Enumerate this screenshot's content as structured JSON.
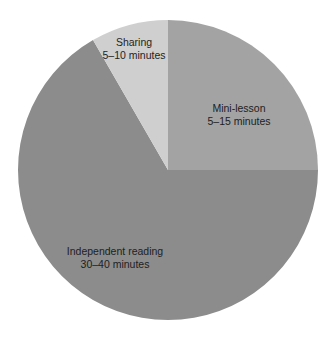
{
  "chart_data": {
    "type": "pie",
    "title": "",
    "start_angle_deg": 0,
    "direction": "clockwise",
    "categories": [
      "Mini-lesson",
      "Independent reading",
      "Sharing"
    ],
    "values": [
      90,
      240,
      30
    ],
    "units": "degrees",
    "slices": [
      {
        "label": "Mini-lesson",
        "sublabel": "5–15 minutes",
        "degrees": 90,
        "color": "#a3a3a3"
      },
      {
        "label": "Independent reading",
        "sublabel": "30–40 minutes",
        "degrees": 240,
        "color": "#8c8c8c"
      },
      {
        "label": "Sharing",
        "sublabel": "5–10 minutes",
        "degrees": 30,
        "color": "#cfcfcf"
      }
    ],
    "legend": null,
    "grid": false
  },
  "labels": {
    "mini": {
      "title": "Mini-lesson",
      "time": "5–15 minutes"
    },
    "independent": {
      "title": "Independent reading",
      "time": "30–40 minutes"
    },
    "sharing": {
      "title": "Sharing",
      "time": "5–10 minutes"
    }
  }
}
